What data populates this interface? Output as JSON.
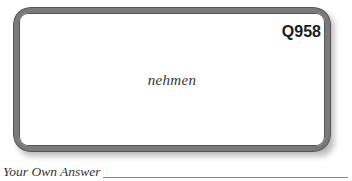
{
  "card": {
    "question_id": "Q958",
    "word": "nehmen"
  },
  "answer": {
    "label": "Your Own Answer",
    "value": ""
  }
}
